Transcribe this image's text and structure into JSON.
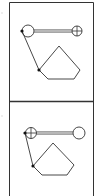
{
  "figure": {
    "width": 102,
    "height": 196,
    "frame": {
      "left": 9.5,
      "right": 93.5,
      "top": 2.5,
      "divider": 101.5,
      "stroke": "#333333"
    },
    "side_marks": [
      {
        "x": 2,
        "y": 13,
        "color": "#bbbbbb"
      },
      {
        "x": 2,
        "y": 116,
        "color": "#bbbbbb"
      }
    ],
    "panels": [
      {
        "name": "panel-top",
        "plain_circle": {
          "cx": 28,
          "cy": 31,
          "r": 6
        },
        "crosshair_circle": {
          "cx": 77,
          "cy": 31,
          "r": 5
        },
        "double_line": {
          "x1": 34,
          "x2": 72,
          "y": 31,
          "gap": 1.5
        },
        "dots": [
          {
            "cx": 22,
            "cy": 31
          },
          {
            "cx": 39,
            "cy": 70
          }
        ],
        "diagonal": {
          "x1": 22,
          "y1": 31,
          "x2": 39,
          "y2": 70
        },
        "pentagon": "39,70 59,46 80,70 74,79 48,79"
      },
      {
        "name": "panel-bottom",
        "plain_circle": {
          "cx": 79,
          "cy": 133,
          "r": 6
        },
        "crosshair_circle": {
          "cx": 31,
          "cy": 133,
          "r": 5.5
        },
        "double_line": {
          "x1": 36.5,
          "x2": 73,
          "y": 133,
          "gap": 1.5
        },
        "dots": [
          {
            "cx": 25,
            "cy": 133
          },
          {
            "cx": 33,
            "cy": 166
          }
        ],
        "diagonal": {
          "x1": 25,
          "y1": 133,
          "x2": 33,
          "y2": 166
        },
        "pentagon": "33,166 53,143 74,165 67,175 42,175"
      }
    ],
    "colors": {
      "line": "#333333",
      "dot": "#111111",
      "background": "#ffffff"
    }
  }
}
